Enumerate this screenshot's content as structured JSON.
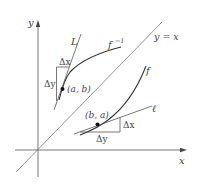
{
  "figure": {
    "axes": {
      "x_label": "x",
      "y_label": "y"
    },
    "diagonal_label": "y = x",
    "curves": {
      "f_label": "f",
      "f_inverse_label": "f",
      "f_inverse_superscript": "−1"
    },
    "tangent_lines": {
      "L_label": "L",
      "ell_label": "ℓ"
    },
    "points": {
      "ab_label": "(a, b)",
      "ba_label": "(b, a)"
    },
    "increments": {
      "upper_dx": "Δx",
      "upper_dy": "Δy",
      "lower_dx": "Δx",
      "lower_dy": "Δy"
    },
    "colors": {
      "axis": "#555555",
      "curve": "#333333",
      "text": "#444444"
    }
  }
}
